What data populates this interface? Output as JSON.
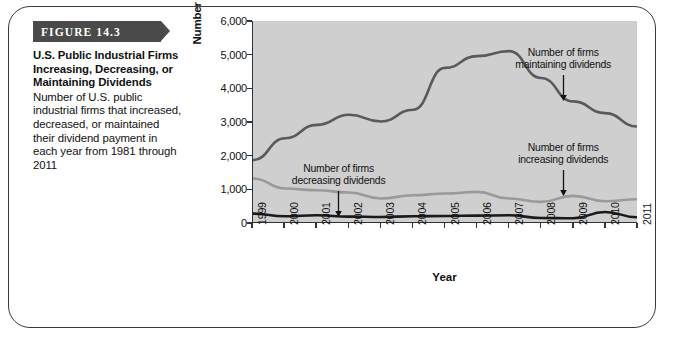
{
  "figure": {
    "banner_label": "FIGURE 14.3",
    "title": "U.S. Public Industrial Firms Increasing, Decreasing, or Maintaining Dividends",
    "description": "Number of U.S. public industrial firms that increased, decreased, or maintained their dividend payment in each year from 1981 through 2011"
  },
  "colors": {
    "banner": "#4a4a4a",
    "plot_background": "#cfcfcf",
    "axis": "#333333",
    "maintaining_line": "#5a5a5a",
    "increasing_line": "#9a9a9a",
    "decreasing_line": "#1a1a1a",
    "page_border": "#3a3a3a"
  },
  "chart_data": {
    "type": "line",
    "title": "",
    "xlabel": "Year",
    "ylabel": "Number of Firms",
    "x": [
      1999,
      2000,
      2001,
      2002,
      2003,
      2004,
      2005,
      2006,
      2007,
      2008,
      2009,
      2010,
      2011
    ],
    "xlim": [
      1999,
      2011
    ],
    "ylim": [
      0,
      6000
    ],
    "yticks": [
      0,
      1000,
      2000,
      3000,
      4000,
      5000,
      6000
    ],
    "ytick_labels": [
      "0",
      "1,000",
      "2,000",
      "3,000",
      "4,000",
      "5,000",
      "6,000"
    ],
    "xtick_labels": [
      "1999",
      "2000",
      "2001",
      "2002",
      "2003",
      "2004",
      "2005",
      "2006",
      "2007",
      "2008",
      "2009",
      "2010",
      "2011"
    ],
    "grid": false,
    "legend": "annotations",
    "series": [
      {
        "name": "Number of firms maintaining dividends",
        "color": "#5a5a5a",
        "values": [
          1850,
          2500,
          2900,
          3200,
          3000,
          3350,
          4600,
          4950,
          5100,
          4300,
          3600,
          3250,
          2850
        ]
      },
      {
        "name": "Number of firms increasing dividends",
        "color": "#9a9a9a",
        "values": [
          1300,
          1000,
          950,
          880,
          700,
          800,
          850,
          900,
          700,
          600,
          780,
          620,
          680
        ]
      },
      {
        "name": "Number of firms decreasing dividends",
        "color": "#1a1a1a",
        "values": [
          250,
          170,
          200,
          160,
          150,
          170,
          180,
          190,
          200,
          120,
          110,
          300,
          140
        ]
      }
    ],
    "annotations": [
      {
        "text_line1": "Number of firms",
        "text_line2": "maintaining dividends",
        "target_x": 2008.7,
        "target_y": 3620
      },
      {
        "text_line1": "Number of firms",
        "text_line2": "decreasing dividends",
        "target_x": 2001.7,
        "target_y": 190
      },
      {
        "text_line1": "Number of firms",
        "text_line2": "increasing dividends",
        "target_x": 2008.7,
        "target_y": 790
      }
    ]
  }
}
